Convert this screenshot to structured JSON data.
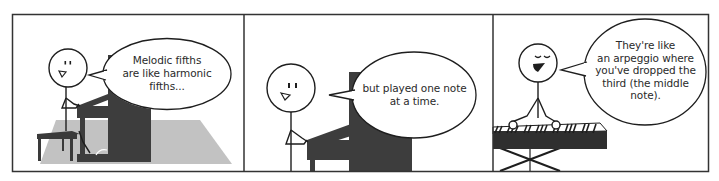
{
  "comic": {
    "panel_count": 3,
    "colors": {
      "border": "#333333",
      "ink": "#1e1e1e",
      "piano": "#3d3d3d",
      "floor": "#bfbfbf",
      "background": "#ffffff"
    },
    "panels": [
      {
        "id": "panel-1",
        "scene": "stick figure seated at upright piano on grey floor",
        "speech": "Melodic fifths\nare like harmonic\nfifths..."
      },
      {
        "id": "panel-2",
        "scene": "stick figure seated at upright piano",
        "speech": "but played one note\nat a time."
      },
      {
        "id": "panel-3",
        "scene": "stick figure with closed eyes playing keyboard on X-stand",
        "speech": "They're like\nan arpeggio where\nyou've dropped the\nthird (the middle\nnote)."
      }
    ]
  }
}
